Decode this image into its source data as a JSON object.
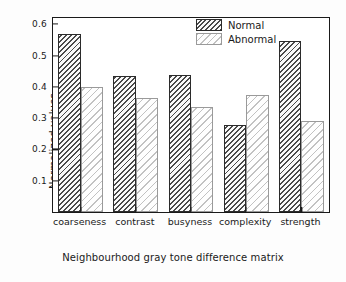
{
  "chart_data": {
    "type": "bar",
    "title": "",
    "xlabel": "Neighbourhood gray tone difference matrix",
    "ylabel": "Normalized values",
    "categories": [
      "coarseness",
      "contrast",
      "busyness",
      "complexity",
      "strength"
    ],
    "series": [
      {
        "name": "Normal",
        "values": [
          0.57,
          0.434,
          0.439,
          0.278,
          0.545
        ],
        "color": "#4a4a4a",
        "hatch": "back-diagonal-dense"
      },
      {
        "name": "Abnormal",
        "values": [
          0.398,
          0.365,
          0.337,
          0.374,
          0.291
        ],
        "color": "#c2c2c2",
        "hatch": "back-diagonal-sparse"
      }
    ],
    "yticks": [
      0.1,
      0.2,
      0.3,
      0.4,
      0.5,
      0.6
    ],
    "ytick_labels": [
      "0.1",
      "0.2",
      "0.3",
      "0.4",
      "0.5",
      "0.6"
    ],
    "ylim": [
      0.0,
      0.62
    ],
    "grid": false,
    "legend_position": "top-right"
  }
}
